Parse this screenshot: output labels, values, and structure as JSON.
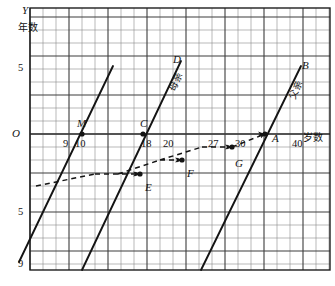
{
  "figure": {
    "type": "coordinate-grid-diagram",
    "axes": {
      "y_axis_name": "Y",
      "y_axis_unit_label": "年数",
      "x_axis_unit_label": "岁数",
      "origin_label": "O"
    },
    "y_ticks": [
      {
        "label": "5",
        "x": 18,
        "y": 63
      },
      {
        "label": "O",
        "x": 12,
        "y": 128
      },
      {
        "label": "5",
        "x": 18,
        "y": 207
      },
      {
        "label": "9",
        "x": 18,
        "y": 259
      }
    ],
    "x_ticks": [
      {
        "label": "9",
        "x": 63,
        "y": 139
      },
      {
        "label": "10",
        "x": 75,
        "y": 139
      },
      {
        "label": "18",
        "x": 141,
        "y": 139
      },
      {
        "label": "20",
        "x": 163,
        "y": 139
      },
      {
        "label": "27",
        "x": 208,
        "y": 139
      },
      {
        "label": "30",
        "x": 235,
        "y": 139
      },
      {
        "label": "40",
        "x": 292,
        "y": 139
      }
    ],
    "point_labels": [
      {
        "name": "M",
        "text": "M",
        "x": 77,
        "y": 118
      },
      {
        "name": "C",
        "text": "C",
        "x": 140,
        "y": 118
      },
      {
        "name": "D",
        "text": "D",
        "x": 173,
        "y": 54
      },
      {
        "name": "B",
        "text": "B",
        "x": 302,
        "y": 60
      },
      {
        "name": "A",
        "text": "A",
        "x": 272,
        "y": 133
      },
      {
        "name": "G",
        "text": "G",
        "x": 235,
        "y": 158
      },
      {
        "name": "F",
        "text": "F",
        "x": 187,
        "y": 168
      },
      {
        "name": "E",
        "text": "E",
        "x": 145,
        "y": 182
      }
    ],
    "line_labels": [
      {
        "name": "mother-line-label",
        "text": "母亲",
        "x": 165,
        "y": 88
      },
      {
        "name": "father-line-label",
        "text": "父亲",
        "x": 285,
        "y": 96
      }
    ],
    "lines": [
      {
        "name": "line-M",
        "x1": 19,
        "y1": 262,
        "x2": 113,
        "y2": 66
      },
      {
        "name": "line-CD",
        "x1": 82,
        "y1": 270,
        "x2": 181,
        "y2": 61
      },
      {
        "name": "line-AB",
        "x1": 201,
        "y1": 270,
        "x2": 301,
        "y2": 66
      }
    ],
    "points": [
      {
        "name": "point-M",
        "x": 82,
        "y": 134
      },
      {
        "name": "point-C",
        "x": 143,
        "y": 134
      },
      {
        "name": "point-A",
        "x": 265,
        "y": 134
      },
      {
        "name": "point-E",
        "x": 140,
        "y": 174
      },
      {
        "name": "point-F",
        "x": 182,
        "y": 160
      },
      {
        "name": "point-G",
        "x": 232,
        "y": 147
      }
    ],
    "dashed_path": "M 36,186 L 82,174 L 140,174 L 82,160 L 182,160 L 82,147 L 232,147 L 265,134",
    "grid": {
      "left": 30,
      "top": 8,
      "right": 330,
      "bottom": 270,
      "cell": 13,
      "major_every": 3,
      "minor_color": "#8a8a8a",
      "major_color": "#3c3c3c",
      "border_color": "#1e1e1e",
      "axis_color": "#3c3c3c"
    },
    "ink_color": "#141414"
  }
}
